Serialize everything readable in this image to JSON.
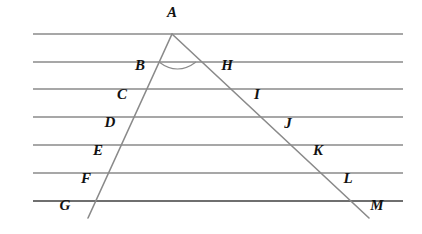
{
  "figure": {
    "width": 422,
    "height": 234,
    "background_color": "#ffffff",
    "line_color": "#8a8a8a",
    "baseline_color": "#6f6f6f",
    "label_color": "#111111"
  },
  "parallel_lines": [
    {
      "name": "line-1",
      "y": 34,
      "x1": 33,
      "x2": 403
    },
    {
      "name": "line-2",
      "y": 62,
      "x1": 33,
      "x2": 403
    },
    {
      "name": "line-3",
      "y": 89,
      "x1": 33,
      "x2": 403
    },
    {
      "name": "line-4",
      "y": 117,
      "x1": 33,
      "x2": 403
    },
    {
      "name": "line-5",
      "y": 145,
      "x1": 33,
      "x2": 403
    },
    {
      "name": "line-6",
      "y": 173,
      "x1": 33,
      "x2": 403
    },
    {
      "name": "line-7",
      "y": 201,
      "x1": 33,
      "x2": 403
    }
  ],
  "triangle": {
    "apex": {
      "label": "A",
      "x": 172,
      "y": 34
    },
    "left_side": {
      "from": "A",
      "to": "G",
      "x1": 172,
      "y1": 34,
      "x2": 88,
      "y2": 218
    },
    "right_side": {
      "from": "A",
      "to": "M",
      "x1": 172,
      "y1": 34,
      "x2": 369,
      "y2": 218
    }
  },
  "angle_arc": {
    "vertex": "A",
    "start_x": 159,
    "start_y": 62,
    "end_x": 196,
    "end_y": 62,
    "sag": 7
  },
  "points": {
    "left_chain": [
      {
        "label": "A",
        "x": 172,
        "y": 34,
        "label_x": 172,
        "label_y": 14
      },
      {
        "label": "B",
        "x": 159,
        "y": 62,
        "label_x": 140,
        "label_y": 67
      },
      {
        "label": "C",
        "x": 147,
        "y": 89,
        "label_x": 122,
        "label_y": 96
      },
      {
        "label": "D",
        "x": 134,
        "y": 117,
        "label_x": 110,
        "label_y": 124
      },
      {
        "label": "E",
        "x": 122,
        "y": 145,
        "label_x": 98,
        "label_y": 152
      },
      {
        "label": "F",
        "x": 109,
        "y": 173,
        "label_x": 86,
        "label_y": 180
      },
      {
        "label": "G",
        "x": 97,
        "y": 201,
        "label_x": 65,
        "label_y": 207
      }
    ],
    "right_chain": [
      {
        "label": "H",
        "x": 196,
        "y": 62,
        "label_x": 227,
        "label_y": 67
      },
      {
        "label": "I",
        "x": 226,
        "y": 89,
        "label_x": 257,
        "label_y": 96
      },
      {
        "label": "J",
        "x": 256,
        "y": 117,
        "label_x": 288,
        "label_y": 125
      },
      {
        "label": "K",
        "x": 286,
        "y": 145,
        "label_x": 318,
        "label_y": 152
      },
      {
        "label": "L",
        "x": 316,
        "y": 173,
        "label_x": 348,
        "label_y": 180
      },
      {
        "label": "M",
        "x": 347,
        "y": 201,
        "label_x": 377,
        "label_y": 207
      }
    ]
  }
}
